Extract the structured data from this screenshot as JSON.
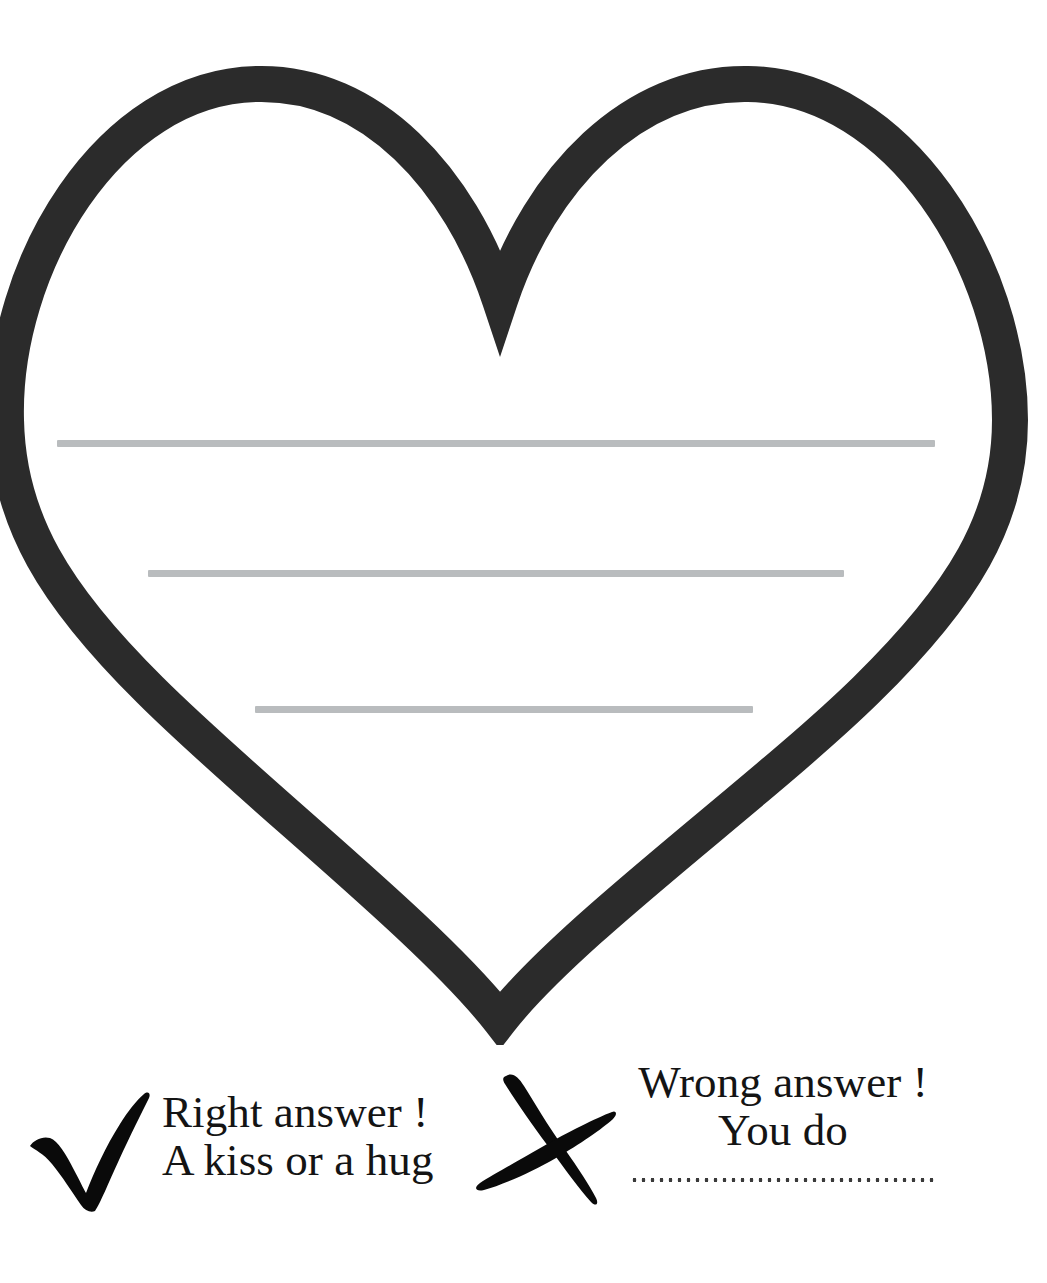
{
  "page": {
    "background_color": "#ffffff",
    "type": "worksheet"
  },
  "heart": {
    "name": "heart-outline",
    "stroke_color": "#2b2b2b",
    "fill_color": "#ffffff",
    "stroke_width_px": 36,
    "writing_lines": [
      {
        "label": "writing-line-1",
        "color": "#b9bcbe",
        "length_px": 878
      },
      {
        "label": "writing-line-2",
        "color": "#b9bcbe",
        "length_px": 696
      },
      {
        "label": "writing-line-3",
        "color": "#b9bcbe",
        "length_px": 498
      }
    ]
  },
  "legend": {
    "correct": {
      "icon": "check-mark-icon",
      "icon_color": "#0a0a0a",
      "line1": "Right answer !",
      "line2": "A kiss or a hug"
    },
    "wrong": {
      "icon": "cross-mark-icon",
      "icon_color": "#0a0a0a",
      "line1": "Wrong answer !",
      "line2": "You do",
      "fill_in_line": "......................................."
    }
  }
}
